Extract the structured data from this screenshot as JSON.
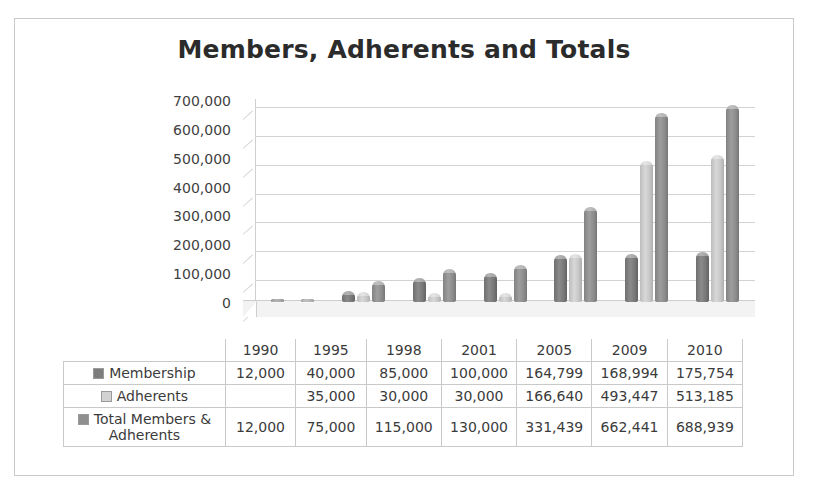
{
  "chart_data": {
    "type": "bar",
    "title": "Members, Adherents and Totals",
    "xlabel": "",
    "ylabel": "",
    "ylim": [
      0,
      700000
    ],
    "ytick_labels": [
      "700,000",
      "600,000",
      "500,000",
      "400,000",
      "300,000",
      "200,000",
      "100,000",
      "0"
    ],
    "yticks": [
      700000,
      600000,
      500000,
      400000,
      300000,
      200000,
      100000,
      0
    ],
    "grid": true,
    "legend_position": "data-table",
    "style": "3d-cylinder",
    "categories": [
      "1990",
      "1995",
      "1998",
      "2001",
      "2005",
      "2009",
      "2010"
    ],
    "series": [
      {
        "name": "Membership",
        "color": "#7d7d7d",
        "values": [
          12000,
          40000,
          85000,
          100000,
          164799,
          168994,
          175754
        ],
        "labels": [
          "12,000",
          "40,000",
          "85,000",
          "100,000",
          "164,799",
          "168,994",
          "175,754"
        ]
      },
      {
        "name": "Adherents",
        "color": "#d2d2d2",
        "values": [
          null,
          35000,
          30000,
          30000,
          166640,
          493447,
          513185
        ],
        "labels": [
          "",
          "35,000",
          "30,000",
          "30,000",
          "166,640",
          "493,447",
          "513,185"
        ]
      },
      {
        "name": "Total Members & Adherents",
        "color": "#8f8f8f",
        "values": [
          12000,
          75000,
          115000,
          130000,
          331439,
          662441,
          688939
        ],
        "labels": [
          "12,000",
          "75,000",
          "115,000",
          "130,000",
          "331,439",
          "662,441",
          "688,939"
        ]
      }
    ]
  },
  "table": {
    "corner": "",
    "years": [
      "1990",
      "1995",
      "1998",
      "2001",
      "2005",
      "2009",
      "2010"
    ],
    "rows": [
      {
        "key": "k0",
        "label": "Membership",
        "label2": "",
        "values": [
          "12,000",
          "40,000",
          "85,000",
          "100,000",
          "164,799",
          "168,994",
          "175,754"
        ]
      },
      {
        "key": "k1",
        "label": "Adherents",
        "label2": "",
        "values": [
          "",
          "35,000",
          "30,000",
          "30,000",
          "166,640",
          "493,447",
          "513,185"
        ]
      },
      {
        "key": "k2",
        "label": "Total Members &",
        "label2": "Adherents",
        "values": [
          "12,000",
          "75,000",
          "115,000",
          "130,000",
          "331,439",
          "662,441",
          "688,939"
        ]
      }
    ]
  }
}
